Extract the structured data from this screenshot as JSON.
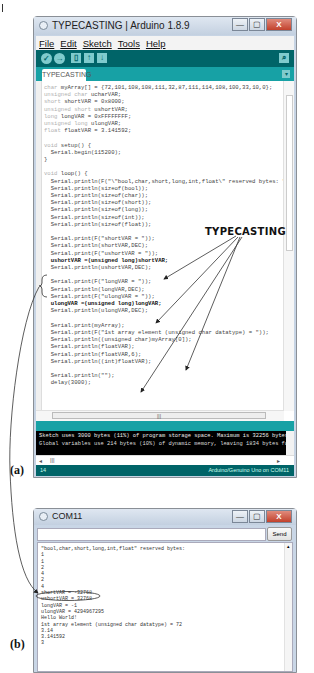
{
  "arduino_window": {
    "title": "TYPECASTING | Arduino 1.8.9",
    "window_buttons": {
      "minimize": "—",
      "maximize": "▢",
      "close": "X"
    },
    "menu": [
      "File",
      "Edit",
      "Sketch",
      "Tools",
      "Help"
    ],
    "toolbar": {
      "verify_icon": "✓",
      "upload_icon": "→",
      "new_icon": "▯",
      "open_icon": "↑",
      "save_icon": "↓",
      "serial_monitor_icon": "⌕"
    },
    "tab": {
      "label": "TYPECASTING",
      "menu_icon": "▾"
    },
    "code_lines": [
      {
        "kw": "char ",
        "rest": "myArray[] = {72,101,108,108,111,32,87,111,114,108,100,33,10,0};"
      },
      {
        "kw": "unsigned char ",
        "rest": "ucharVAR;"
      },
      {
        "kw": "short ",
        "rest": "shortVAR = 0x8000;"
      },
      {
        "kw": "unsigned short ",
        "rest": "ushortVAR;"
      },
      {
        "kw": "long ",
        "rest": "longVAR = 0xFFFFFFFF;"
      },
      {
        "kw": "unsigned long ",
        "rest": "ulongVAR;"
      },
      {
        "kw": "float ",
        "rest": "floatVAR = 3.141592;"
      },
      {
        "kw": "",
        "rest": ""
      },
      {
        "kw": "void ",
        "rest": "setup() {"
      },
      {
        "kw": "",
        "rest": "  Serial.begin(115200);"
      },
      {
        "kw": "",
        "rest": "}"
      },
      {
        "kw": "",
        "rest": ""
      },
      {
        "kw": "void ",
        "rest": "loop() {"
      },
      {
        "kw": "",
        "rest": "  Serial.println(F(\"\\\"bool,char,short,long,int,float\\\" reserved bytes: \"));"
      },
      {
        "kw": "",
        "rest": "  Serial.println(sizeof(bool));"
      },
      {
        "kw": "",
        "rest": "  Serial.println(sizeof(char));"
      },
      {
        "kw": "",
        "rest": "  Serial.println(sizeof(short));"
      },
      {
        "kw": "",
        "rest": "  Serial.println(sizeof(long));"
      },
      {
        "kw": "",
        "rest": "  Serial.println(sizeof(int));"
      },
      {
        "kw": "",
        "rest": "  Serial.println(sizeof(float));"
      },
      {
        "kw": "",
        "rest": ""
      },
      {
        "kw": "",
        "rest": "  Serial.print(F(\"shortVAR = \"));"
      },
      {
        "kw": "",
        "rest": "  Serial.println(shortVAR,DEC);"
      },
      {
        "kw": "",
        "rest": "  Serial.print(F(\"ushortVAR = \"));"
      },
      {
        "kw": "",
        "rest": "  ushortVAR =(unsigned long)shortVAR;"
      },
      {
        "kw": "",
        "rest": "  Serial.println(ushortVAR,DEC);"
      },
      {
        "kw": "",
        "rest": ""
      },
      {
        "kw": "",
        "rest": "  Serial.print(F(\"longVAR = \"));"
      },
      {
        "kw": "",
        "rest": "  Serial.println(longVAR,DEC);"
      },
      {
        "kw": "",
        "rest": "  Serial.print(F(\"ulongVAR = \"));"
      },
      {
        "kw": "",
        "rest": "  ulongVAR =(unsigned long)longVAR;"
      },
      {
        "kw": "",
        "rest": "  Serial.println(ulongVAR,DEC);"
      },
      {
        "kw": "",
        "rest": ""
      },
      {
        "kw": "",
        "rest": "  Serial.print(myArray);"
      },
      {
        "kw": "",
        "rest": "  Serial.print(F(\"1st array element (unsigned char datatype) = \"));"
      },
      {
        "kw": "",
        "rest": "  Serial.println((unsigned char)myArray[0]);"
      },
      {
        "kw": "",
        "rest": "  Serial.println(floatVAR);"
      },
      {
        "kw": "",
        "rest": "  Serial.println(floatVAR,6);"
      },
      {
        "kw": "",
        "rest": "  Serial.println((int)floatVAR);"
      },
      {
        "kw": "",
        "rest": ""
      },
      {
        "kw": "",
        "rest": "  Serial.println(\"\");"
      },
      {
        "kw": "",
        "rest": "  delay(3000);"
      }
    ],
    "hscroll_thumb": "|||",
    "console_lines": [
      "Sketch uses 3000 bytes (11%) of program storage space. Maximum is 32256 bytes.",
      "Global variables use 214 bytes (10%) of dynamic memory, leaving 1834 bytes for local variables."
    ],
    "console_hscroll": "|||",
    "status": {
      "line": "14",
      "board": "Arduino/Genuino Uno on COM11"
    }
  },
  "annotation": {
    "title": "TYPECASTING",
    "label_a": "(a)",
    "label_b": "(b)"
  },
  "serial_monitor": {
    "title": "COM11",
    "window_buttons": {
      "minimize": "—",
      "maximize": "▢",
      "close": "X"
    },
    "input_value": "",
    "send_label": "Send",
    "output_lines": [
      "\"bool,char,short,long,int,float\" reserved bytes:",
      "1",
      "1",
      "2",
      "4",
      "2",
      "4",
      "shortVAR = -32768",
      "ushortVAR = 32768",
      "longVAR = -1",
      "ulongVAR = 4294967295",
      "Hello World!",
      "1st array element (unsigned char datatype) = 72",
      "3.14",
      "3.141592",
      "3"
    ],
    "highlighted_line_index": 8
  }
}
